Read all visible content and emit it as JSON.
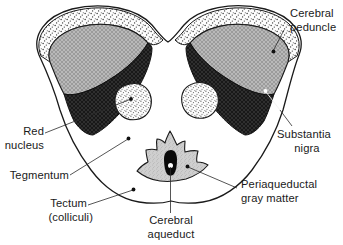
{
  "figure": {
    "background_color": "#ffffff",
    "ink_color": "#1a1a1a"
  },
  "labels": {
    "cerebral_peduncle": {
      "line1": "Cerebral",
      "line2": "peduncle"
    },
    "substantia_nigra": {
      "line1": "Substantia",
      "line2": "nigra"
    },
    "red_nucleus": {
      "line1": "Red",
      "line2": "nucleus"
    },
    "tegmentum": {
      "line1": "Tegmentum"
    },
    "tectum": {
      "line1": "Tectum",
      "line2": "(colliculi)"
    },
    "periaqueductal_gray": {
      "line1": "Periaqueductal",
      "line2": "gray matter"
    },
    "cerebral_aqueduct": {
      "line1": "Cerebral",
      "line2": "aqueduct"
    }
  },
  "structures": [
    {
      "key": "cerebral-peduncle-left",
      "name": "Cerebral peduncle (left)",
      "fill": "#b4b4b4",
      "texture": "crosshatch"
    },
    {
      "key": "cerebral-peduncle-right",
      "name": "Cerebral peduncle (right)",
      "fill": "#b4b4b4",
      "texture": "crosshatch"
    },
    {
      "key": "substantia-nigra-left",
      "name": "Substantia nigra (left)",
      "fill": "#3a3a3a",
      "texture": "crosshatch-dark"
    },
    {
      "key": "substantia-nigra-right",
      "name": "Substantia nigra (right)",
      "fill": "#3a3a3a",
      "texture": "crosshatch-dark"
    },
    {
      "key": "outer-rim-left",
      "name": "Pial/outer rim (left)",
      "fill": "#ffffff",
      "texture": "stipple"
    },
    {
      "key": "outer-rim-right",
      "name": "Pial/outer rim (right)",
      "fill": "#ffffff",
      "texture": "stipple"
    },
    {
      "key": "red-nucleus-left",
      "name": "Red nucleus (left)",
      "fill": "#ffffff",
      "texture": "stipple"
    },
    {
      "key": "red-nucleus-right",
      "name": "Red nucleus (right)",
      "fill": "#ffffff",
      "texture": "stipple"
    },
    {
      "key": "periaqueductal-gray",
      "name": "Periaqueductal gray matter",
      "fill": "#cccccc",
      "texture": "stipple-fine"
    },
    {
      "key": "cerebral-aqueduct",
      "name": "Cerebral aqueduct",
      "fill": "#0a0a0a",
      "texture": "solid"
    },
    {
      "key": "tegmentum",
      "name": "Tegmentum",
      "fill": "#ffffff",
      "texture": "none"
    },
    {
      "key": "tectum",
      "name": "Tectum (colliculi)",
      "fill": "#ffffff",
      "texture": "none"
    }
  ]
}
